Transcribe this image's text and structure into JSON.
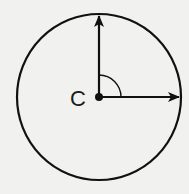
{
  "diagram": {
    "type": "geometry",
    "center_label": "C",
    "circle": {
      "cx": 99,
      "cy": 97,
      "rx": 82,
      "ry": 83
    },
    "vectors": [
      {
        "name": "up",
        "from": [
          99,
          97
        ],
        "to": [
          99,
          14
        ]
      },
      {
        "name": "right",
        "from": [
          99,
          97
        ],
        "to": [
          181,
          97
        ]
      }
    ],
    "angle_marker": {
      "radius": 22,
      "between": [
        "up",
        "right"
      ]
    },
    "colors": {
      "stroke": "#111111",
      "background": "#f1f1f0"
    }
  }
}
